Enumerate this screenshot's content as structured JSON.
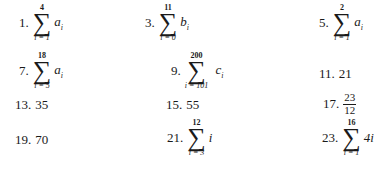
{
  "answers": [
    {
      "num": "1.",
      "type": "sum",
      "upper": "4",
      "lower": "i = 1",
      "term": "a",
      "sub": "i"
    },
    {
      "num": "3.",
      "type": "sum",
      "upper": "11",
      "lower": "i = 0",
      "term": "b",
      "sub": "i"
    },
    {
      "num": "5.",
      "type": "sum",
      "upper": "2",
      "lower": "i = 1",
      "term": "a",
      "sub": "i"
    },
    {
      "num": "7.",
      "type": "sum",
      "upper": "18",
      "lower": "i = 5",
      "term": "a",
      "sub": "i"
    },
    {
      "num": "9.",
      "type": "sum",
      "upper": "200",
      "lower": "i = 101",
      "term": "c",
      "sub": "i"
    },
    {
      "num": "11.",
      "type": "value",
      "value": "21"
    },
    {
      "num": "13.",
      "type": "value",
      "value": "35"
    },
    {
      "num": "15.",
      "type": "value",
      "value": "55"
    },
    {
      "num": "17.",
      "type": "fraction",
      "numerator": "23",
      "denominator": "12"
    },
    {
      "num": "19.",
      "type": "value",
      "value": "70"
    },
    {
      "num": "21.",
      "type": "sum",
      "upper": "12",
      "lower": "i = 3",
      "term": "i",
      "sub": ""
    },
    {
      "num": "23.",
      "type": "sum",
      "upper": "16",
      "lower": "i = 1",
      "term": "4i",
      "sub": ""
    }
  ],
  "sigma": "∑"
}
